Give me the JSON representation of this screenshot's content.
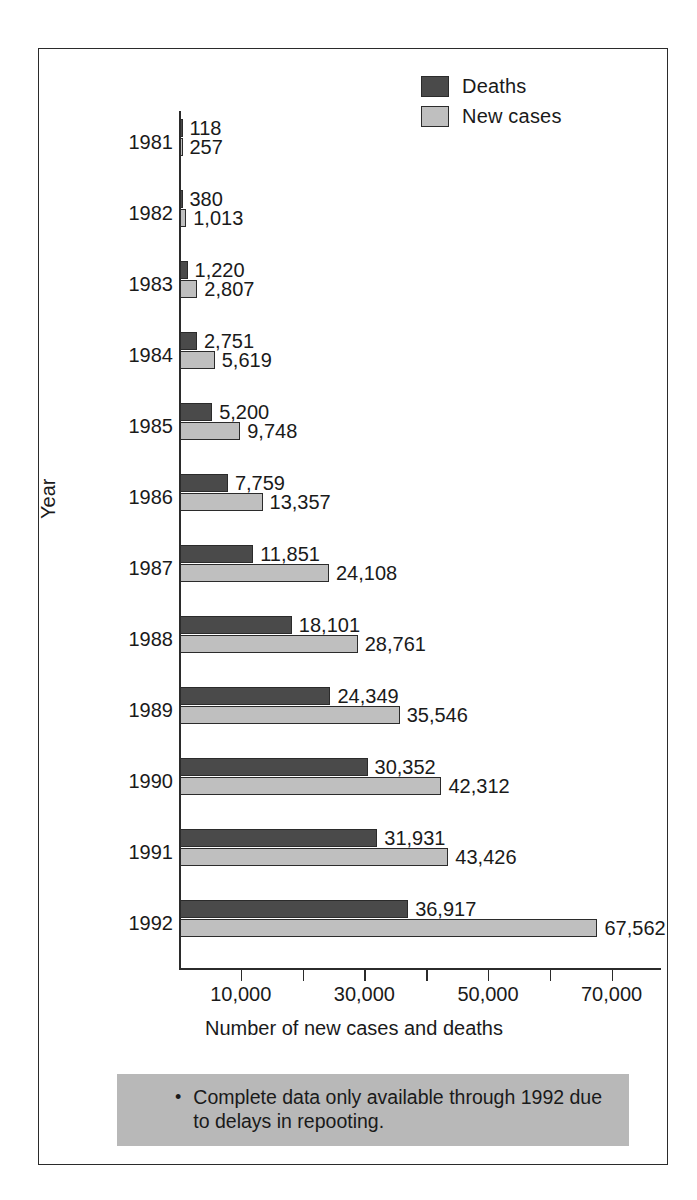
{
  "chart_data": {
    "type": "bar",
    "orientation": "horizontal",
    "title": "",
    "xlabel": "Number of new cases and deaths",
    "ylabel": "Year",
    "categories": [
      "1981",
      "1982",
      "1983",
      "1984",
      "1985",
      "1986",
      "1987",
      "1988",
      "1989",
      "1990",
      "1991",
      "1992"
    ],
    "series": [
      {
        "name": "Deaths",
        "color": "#4a4a4a",
        "values": [
          118,
          380,
          1220,
          2751,
          5200,
          7759,
          11851,
          18101,
          24349,
          30352,
          31931,
          36917
        ],
        "labels": [
          "118",
          "380",
          "1,220",
          "2,751",
          "5,200",
          "7,759",
          "11,851",
          "18,101",
          "24,349",
          "30,352",
          "31,931",
          "36,917"
        ]
      },
      {
        "name": "New cases",
        "color": "#bfbfbf",
        "values": [
          257,
          1013,
          2807,
          5619,
          9748,
          13357,
          24108,
          28761,
          35546,
          42312,
          43426,
          67562
        ],
        "labels": [
          "257",
          "1,013",
          "2,807",
          "5,619",
          "9,748",
          "13,357",
          "24,108",
          "28,761",
          "35,546",
          "42,312",
          "43,426",
          "67,562"
        ]
      }
    ],
    "xlim": [
      0,
      78000
    ],
    "xticks": [
      10000,
      20000,
      30000,
      40000,
      50000,
      60000,
      70000
    ],
    "xtick_labels": [
      "10,000",
      "",
      "30,000",
      "",
      "50,000",
      "",
      "70,000"
    ],
    "grid": false,
    "legend_position": "top-right"
  },
  "legend": {
    "items": [
      {
        "label": "Deaths",
        "swatch": "deaths"
      },
      {
        "label": "New cases",
        "swatch": "cases"
      }
    ]
  },
  "footnote": {
    "bullet": "•",
    "text": "Complete data only available through 1992 due to delays in repooting."
  }
}
